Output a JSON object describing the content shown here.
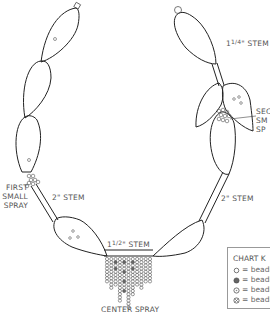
{
  "diagram": {
    "type": "beaded necklace layout diagram",
    "labels": {
      "stem_top_right": {
        "whole": "1",
        "num": "1",
        "den": "4",
        "suffix": "\" STEM"
      },
      "second_spray": [
        "SEC",
        "SM",
        "SP"
      ],
      "first_spray": [
        "FIRST",
        "SMALL",
        "SPRAY"
      ],
      "stem_left": "2\" STEM",
      "stem_right": "2\" STEM",
      "stem_center": {
        "whole": "1",
        "num": "1",
        "den": "2",
        "suffix": "\" STEM"
      },
      "center_spray": "CENTER SPRAY"
    },
    "chart_key": {
      "title": "CHART K",
      "items": [
        {
          "symbol": "open-circle",
          "label": "= beadl"
        },
        {
          "symbol": "filled-circle",
          "label": "= beadl"
        },
        {
          "symbol": "open-diamond-circle",
          "label": "= beadl"
        },
        {
          "symbol": "crossed-circle",
          "label": "= beadl"
        }
      ]
    },
    "colors": {
      "line": "#222222",
      "text": "#555555",
      "bead_fill": "#666666"
    }
  }
}
